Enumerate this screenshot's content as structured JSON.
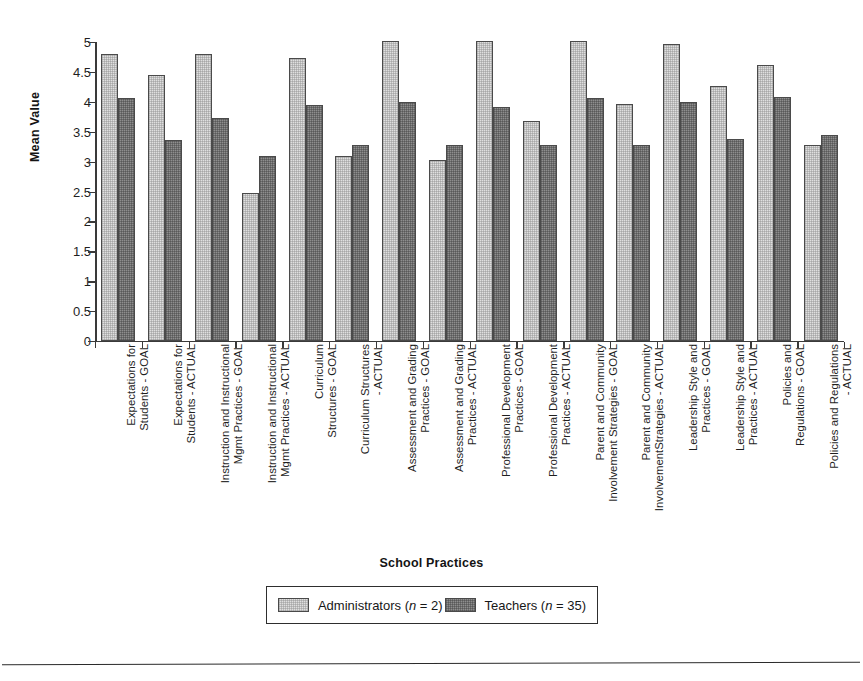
{
  "chart_data": {
    "type": "bar",
    "title": "",
    "xlabel": "School Practices",
    "ylabel": "Mean Value",
    "ylim": [
      0,
      5
    ],
    "yticks": [
      "0",
      "0.5",
      "1",
      "1.5",
      "2",
      "2.5",
      "3",
      "3.5",
      "4",
      "4.5",
      "5"
    ],
    "ytick_values": [
      0,
      0.5,
      1,
      1.5,
      2,
      2.5,
      3,
      3.5,
      4,
      4.5,
      5
    ],
    "grid": false,
    "legend_position": "bottom",
    "categories": [
      "Expectations for\nStudents - GOAL",
      "Expectations for\nStudents - ACTUAL",
      "Instruction and Instructional\nMgmt Practices - GOAL",
      "Instruction and Instructional\nMgmt Practices - ACTUAL",
      "Curriculum\nStructures - GOAL",
      "Curriculum Structures\n- ACTUAL",
      "Assessment and Grading\nPractices - GOAL",
      "Assessment and Grading\nPractices - ACTUAL",
      "Professional Development\nPractices - GOAL",
      "Professional Development\nPractices - ACTUAL",
      "Parent and Community\nInvolvement Strategies - GOAL",
      "Parent and Community\nInvolvementStrategies - ACTUAL",
      "Leadership Style and\nPractices - GOAL",
      "Leadership Style and\nPractices - ACTUAL",
      "Policies and\nRegulations - GOAL",
      "Policies and Regulations\n- ACTUAL"
    ],
    "series": [
      {
        "name": "Administrators (n = 2)",
        "color": "#dfdfdf",
        "values": [
          4.8,
          4.45,
          4.8,
          2.47,
          4.73,
          3.1,
          5.02,
          3.03,
          5.02,
          3.68,
          5.02,
          3.97,
          4.97,
          4.27,
          4.62,
          3.28
        ]
      },
      {
        "name": "Teachers (n = 35)",
        "color": "#8e8e8e",
        "values": [
          4.07,
          3.36,
          3.73,
          3.1,
          3.95,
          3.28,
          4.0,
          3.28,
          3.92,
          3.28,
          4.07,
          3.27,
          4.0,
          3.37,
          4.08,
          3.45
        ]
      }
    ],
    "legend": [
      {
        "label_prefix": "Administrators (",
        "label_italic": "n",
        "label_suffix": " = 2)",
        "swatch": "admin"
      },
      {
        "label_prefix": "Teachers (",
        "label_italic": "n",
        "label_suffix": " = 35)",
        "swatch": "teach"
      }
    ]
  }
}
